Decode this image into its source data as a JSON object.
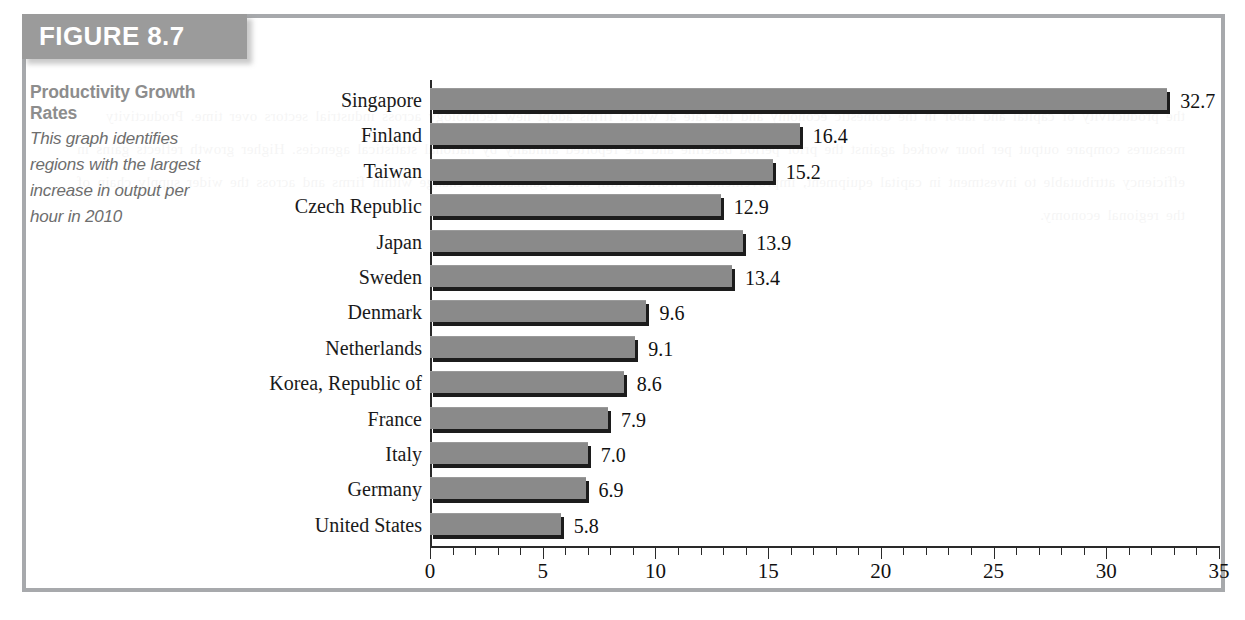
{
  "figure": {
    "banner_label": "FIGURE 8.7",
    "caption_title": "Productivity Growth Rates",
    "caption_body": "This graph identifies regions with the largest increase in output per hour in 2010"
  },
  "colors": {
    "banner_bg": "#9b9b9b",
    "banner_text": "#ffffff",
    "box_border": "#a7a9ac",
    "bar_fill": "#8a8a8a",
    "bar_shadow": "#1c1c1c",
    "axis": "#2a2a2a",
    "caption_title": "#8d8d8d",
    "caption_body": "#6e6e6e"
  },
  "chart_data": {
    "type": "bar",
    "orientation": "horizontal",
    "title": "Productivity Growth Rates",
    "xlabel": "",
    "ylabel": "",
    "xlim": [
      0,
      35
    ],
    "grid": false,
    "legend": null,
    "major_tick_step": 5,
    "minor_tick_step": 1,
    "tick_labels": [
      "0",
      "5",
      "10",
      "15",
      "20",
      "25",
      "30",
      "35"
    ],
    "categories": [
      "Singapore",
      "Finland",
      "Taiwan",
      "Czech Republic",
      "Japan",
      "Sweden",
      "Denmark",
      "Netherlands",
      "Korea, Republic of",
      "France",
      "Italy",
      "Germany",
      "United States"
    ],
    "values": [
      32.7,
      16.4,
      15.2,
      12.9,
      13.9,
      13.4,
      9.6,
      9.1,
      8.6,
      7.9,
      7.0,
      6.9,
      5.8
    ],
    "value_labels": [
      "32.7",
      "16.4",
      "15.2",
      "12.9",
      "13.9",
      "13.4",
      "9.6",
      "9.1",
      "8.6",
      "7.9",
      "7.0",
      "6.9",
      "5.8"
    ]
  },
  "ghost_text": "the productivity of capital and labor in the domestic economy and the rate at which firms adopt new technology across industrial sectors over time. Productivity measures compare output per hour worked against the prior period baseline and are reported annually by national statistical agencies. Higher growth reflects gains in efficiency attributable to investment in capital equipment, improvements in worker skill, and organizational change within firms and across the wider supply chain of the regional economy."
}
